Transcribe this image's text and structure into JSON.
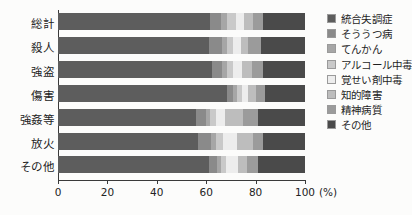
{
  "chart_data": {
    "type": "bar",
    "subtype": "horizontal-100-percent-stacked",
    "title": "",
    "xlabel": "(%)",
    "ylabel": "",
    "xlim": [
      0,
      100
    ],
    "xticks": [
      0,
      20,
      40,
      60,
      80,
      100
    ],
    "xtick_labels": [
      "0",
      "20",
      "40",
      "60",
      "80",
      "100"
    ],
    "unit_label": "(%)",
    "grid": false,
    "legend_position": "right",
    "categories": [
      "総計",
      "殺人",
      "強盗",
      "傷害",
      "強姦等",
      "放火",
      "その他"
    ],
    "series": [
      {
        "name": "統合失調症",
        "color": "#5d5d5d",
        "values": [
          61.5,
          61.0,
          62.5,
          68.5,
          56.0,
          56.5,
          61.0
        ]
      },
      {
        "name": "そううつ病",
        "color": "#8a8a8a",
        "values": [
          4.5,
          5.5,
          4.0,
          2.5,
          4.0,
          5.5,
          3.5
        ]
      },
      {
        "name": "てんかん",
        "color": "#a6a6a6",
        "values": [
          2.5,
          2.0,
          2.0,
          1.5,
          1.5,
          2.0,
          1.5
        ]
      },
      {
        "name": "アルコール中毒",
        "color": "#c9c9c9",
        "values": [
          3.5,
          2.5,
          2.5,
          2.0,
          2.5,
          3.0,
          2.0
        ]
      },
      {
        "name": "覚せい剤中毒",
        "color": "#ededed",
        "values": [
          3.5,
          3.0,
          3.5,
          2.5,
          3.5,
          5.5,
          5.0
        ]
      },
      {
        "name": "知的障害",
        "color": "#bdbdbd",
        "values": [
          3.5,
          3.0,
          4.0,
          3.0,
          7.5,
          6.5,
          3.5
        ]
      },
      {
        "name": "精神病質",
        "color": "#9b9b9b",
        "values": [
          4.0,
          5.0,
          4.5,
          4.0,
          6.0,
          4.0,
          4.5
        ]
      },
      {
        "name": "その他",
        "color": "#4a4a4a",
        "values": [
          17.0,
          18.0,
          17.0,
          16.0,
          19.0,
          17.0,
          19.0
        ]
      }
    ]
  },
  "axis": {
    "tick_labels": [
      "0",
      "20",
      "40",
      "60",
      "80",
      "100"
    ],
    "unit": "(%)"
  },
  "legend": {
    "items": [
      {
        "label": "統合失調症",
        "color": "#5d5d5d"
      },
      {
        "label": "そううつ病",
        "color": "#8a8a8a"
      },
      {
        "label": "てんかん",
        "color": "#a6a6a6"
      },
      {
        "label": "アルコール中毒",
        "color": "#c9c9c9"
      },
      {
        "label": "覚せい剤中毒",
        "color": "#ededed"
      },
      {
        "label": "知的障害",
        "color": "#bdbdbd"
      },
      {
        "label": "精神病質",
        "color": "#9b9b9b"
      },
      {
        "label": "その他",
        "color": "#4a4a4a"
      }
    ]
  }
}
